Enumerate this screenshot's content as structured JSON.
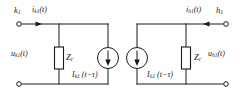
{
  "figure": {
    "background_color": "#ffffff",
    "line_color": "#1a1a1a"
  },
  "left_network": {
    "node_label": "k",
    "node_sub": "1",
    "current_label": "i",
    "current_sub": "k1",
    "current_arg": "(t)",
    "current_arrow_direction": "right",
    "voltage_label": "u",
    "voltage_sub": "k1",
    "voltage_arg": "(t)",
    "impedance_label": "Z",
    "impedance_sub": "c",
    "source_label": "I",
    "source_sub": "k1",
    "source_arg": "(t−τ)",
    "source_arrow_direction": "down"
  },
  "right_network": {
    "node_label": "h",
    "node_sub": "1",
    "current_label": "i",
    "current_sub": "h1",
    "current_arg": "(t)",
    "current_arrow_direction": "left",
    "voltage_label": "u",
    "voltage_sub": "h1",
    "voltage_arg": "(t)",
    "impedance_label": "Z",
    "impedance_sub": "c",
    "source_label": "I",
    "source_sub": "h1",
    "source_arg": "(t−τ)",
    "source_arrow_direction": "down"
  }
}
